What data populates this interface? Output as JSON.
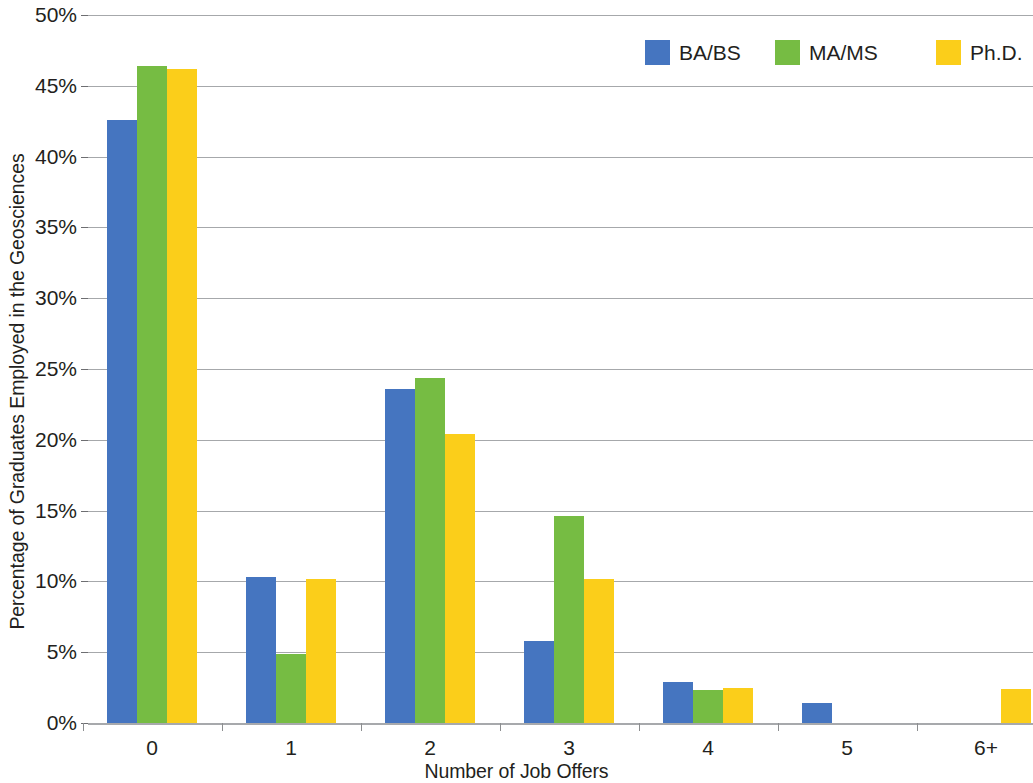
{
  "chart_data": {
    "type": "bar",
    "title": "",
    "subtitle": "",
    "xlabel": "Number of Job Offers",
    "ylabel": "Percentage of Graduates Employed in the Geosciences",
    "categories": [
      "0",
      "1",
      "2",
      "3",
      "4",
      "5",
      "6+"
    ],
    "series": [
      {
        "name": "BA/BS",
        "color": "#4575c0",
        "values": [
          42.6,
          10.3,
          23.6,
          5.8,
          2.9,
          1.4,
          0
        ]
      },
      {
        "name": "MA/MS",
        "color": "#76bc43",
        "values": [
          46.4,
          4.9,
          24.4,
          14.6,
          2.3,
          0,
          0
        ]
      },
      {
        "name": "Ph.D.",
        "color": "#fbce1a",
        "values": [
          46.2,
          10.2,
          20.4,
          10.2,
          2.5,
          0,
          2.4
        ]
      }
    ],
    "ylim": [
      0,
      50
    ],
    "ytick_values": [
      0,
      5,
      10,
      15,
      20,
      25,
      30,
      35,
      40,
      45,
      50
    ],
    "ytick_labels": [
      "0%",
      "5%",
      "10%",
      "15%",
      "20%",
      "25%",
      "30%",
      "35%",
      "40%",
      "45%",
      "50%"
    ],
    "grid": true,
    "grid_axis": "y",
    "legend_position": "top-right",
    "bar_width_px": 30,
    "group_pitch_px": 139,
    "group_first_center_px": 152,
    "plot_left_px": 88,
    "plot_top_px": 15,
    "plot_width_px": 945,
    "plot_height_px": 708,
    "gridline_color": "#a6a8ab",
    "axis_color": "#a7a9ac",
    "text_color": "#231f20",
    "background_color": "#ffffff"
  },
  "legend": {
    "items": [
      {
        "label": "BA/BS",
        "color": "#4575c0",
        "left_px": 645
      },
      {
        "label": "MA/MS",
        "color": "#76bc43",
        "left_px": 775
      },
      {
        "label": "Ph.D.",
        "color": "#fbce1a",
        "left_px": 936
      }
    ]
  }
}
